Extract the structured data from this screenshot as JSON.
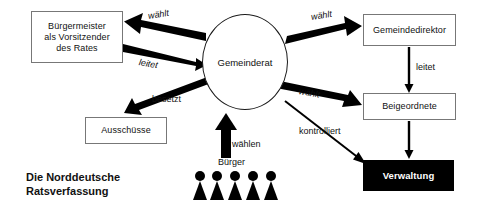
{
  "diagram": {
    "title_line1": "Die Norddeutsche",
    "title_line2": "Ratsverfassung",
    "nodes": {
      "buergermeister": "Bürgermeister\nals Vorsitzender\ndes Rates",
      "buergermeister_line1": "Bürgermeister",
      "buergermeister_line2": "als Vorsitzender",
      "buergermeister_line3": "des Rates",
      "gemeinderat": "Gemeinderat",
      "ausschuesse": "Ausschüsse",
      "gemeindedirektor": "Gemeindedirektor",
      "beigeordnete": "Beigeordnete",
      "verwaltung": "Verwaltung",
      "buerger": "Bürger"
    },
    "edges": [
      {
        "id": "waehlt-bm",
        "label": "wählt",
        "from": "gemeinderat",
        "to": "buergermeister",
        "style": "thick"
      },
      {
        "id": "leitet-bm",
        "label": "leitet",
        "from": "buergermeister",
        "to": "gemeinderat",
        "style": "thick"
      },
      {
        "id": "besetzt",
        "label": "besetzt",
        "from": "gemeinderat",
        "to": "ausschuesse",
        "style": "thick"
      },
      {
        "id": "waehlt-gd",
        "label": "wählt",
        "from": "gemeinderat",
        "to": "gemeindedirektor",
        "style": "thick"
      },
      {
        "id": "waehlt-bg",
        "label": "wählt",
        "from": "gemeinderat",
        "to": "beigeordnete",
        "style": "thick"
      },
      {
        "id": "leitet-gd",
        "label": "leitet",
        "from": "gemeindedirektor",
        "to": "beigeordnete",
        "style": "thin"
      },
      {
        "id": "kontrolliert",
        "label": "kontrolliert",
        "from": "gemeinderat",
        "to": "verwaltung",
        "style": "thin"
      },
      {
        "id": "beigeordnete-verwaltung",
        "label": "",
        "from": "beigeordnete",
        "to": "verwaltung",
        "style": "thin"
      },
      {
        "id": "waehlen",
        "label": "wählen",
        "from": "buerger",
        "to": "gemeinderat",
        "style": "thick"
      }
    ],
    "people_count": 5,
    "colors": {
      "background": "#ffffff",
      "stroke": "#000000",
      "box_border": "#777777",
      "filled_box": "#000000",
      "filled_box_text": "#ffffff",
      "text": "#111111"
    }
  }
}
